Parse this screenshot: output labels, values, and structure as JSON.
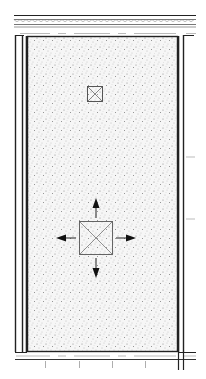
{
  "drawing": {
    "type": "architectural-floor-plan",
    "fill_pattern": "concrete-stipple",
    "colors": {
      "line": "#1a1a1a",
      "stipple": "#7a7a7a",
      "background": "#ffffff",
      "fill": "#f4f4f4"
    },
    "elements": [
      {
        "name": "top-wall-with-insulation",
        "kind": "wall-section"
      },
      {
        "name": "bottom-wall-with-insulation",
        "kind": "wall-section"
      },
      {
        "name": "left-wall",
        "kind": "wall"
      },
      {
        "name": "right-wall",
        "kind": "wall"
      },
      {
        "name": "floor-slab",
        "kind": "concrete-area"
      },
      {
        "name": "small-drain",
        "kind": "square-x-symbol"
      },
      {
        "name": "large-drain",
        "kind": "square-x-symbol"
      },
      {
        "name": "slope-arrows",
        "kind": "arrows",
        "directions": [
          "up",
          "down",
          "left",
          "right"
        ]
      }
    ]
  }
}
